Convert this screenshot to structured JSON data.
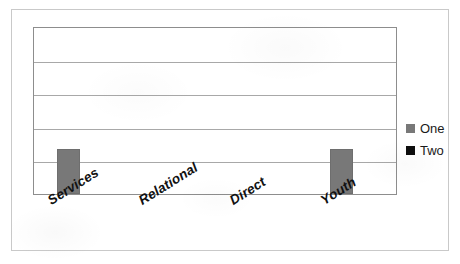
{
  "chart_data": {
    "type": "bar",
    "title": "",
    "subtitle": "",
    "xlabel": "",
    "ylabel": "",
    "categories": [
      "Services",
      "Relational",
      "Direct",
      "Youth"
    ],
    "series": [
      {
        "name": "One",
        "color": "#787878",
        "values": [
          1.35,
          0,
          0,
          1.35
        ]
      },
      {
        "name": "Two",
        "color": "#0d0d0d",
        "values": [
          0,
          0,
          0,
          0
        ]
      }
    ],
    "ylim": [
      0,
      5
    ],
    "yticks": [
      0,
      1,
      2,
      3,
      4,
      5
    ],
    "ytick_labels": [
      "",
      "",
      "",
      "",
      "",
      ""
    ],
    "gridlines": {
      "horizontal": true,
      "vertical": false,
      "count": 5,
      "color": "#a8a8a8"
    },
    "legend": {
      "position": "right",
      "entries": [
        "One",
        "Two"
      ]
    },
    "plot_border_color": "#8d8d8d",
    "frame_border_color": "#c9c9c9",
    "background_color": "#ffffff",
    "xlabel_rotation_deg": -32
  },
  "legend": {
    "entries": [
      {
        "label": "One",
        "color": "#787878",
        "swatch_name": "legend-swatch-one"
      },
      {
        "label": "Two",
        "color": "#0d0d0d",
        "swatch_name": "legend-swatch-two"
      }
    ]
  },
  "x_axis": {
    "labels": [
      "Services",
      "Relational",
      "Direct",
      "Youth"
    ]
  }
}
